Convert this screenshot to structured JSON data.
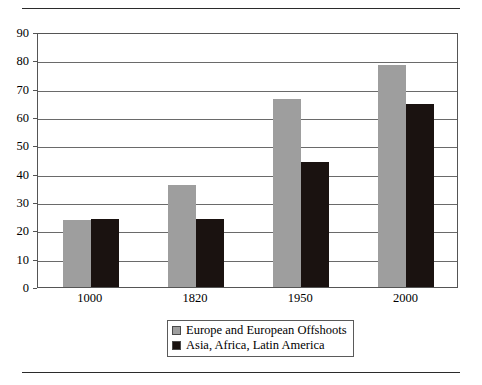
{
  "chart_data": {
    "type": "bar",
    "title": "",
    "subtitle": "",
    "xlabel": "",
    "ylabel": "",
    "categories": [
      "1000",
      "1820",
      "1950",
      "2000"
    ],
    "series": [
      {
        "name": "Europe and European Offshoots",
        "color": "#9e9e9e",
        "values": [
          23.8,
          36.0,
          66.5,
          78.5
        ]
      },
      {
        "name": "Asia, Africa, Latin America",
        "color": "#1a1210",
        "values": [
          23.9,
          24.0,
          44.0,
          64.5
        ]
      }
    ],
    "ylim": [
      0,
      90
    ],
    "ytick_values": [
      0,
      10,
      20,
      30,
      40,
      50,
      60,
      70,
      80,
      90
    ],
    "ytick_labels": [
      "0",
      "10",
      "20",
      "30",
      "40",
      "50",
      "60",
      "70",
      "80",
      "90"
    ],
    "xtick_labels": [
      "1000",
      "1820",
      "1950",
      "2000"
    ],
    "grid": "horizontal",
    "legend_position": "bottom-center",
    "legend_entries": [
      "Europe and European Offshoots",
      "Asia, Africa, Latin America"
    ]
  },
  "figure": {
    "top_rule": "top-horizontal-rule",
    "bottom_rule": "bottom-horizontal-rule"
  }
}
